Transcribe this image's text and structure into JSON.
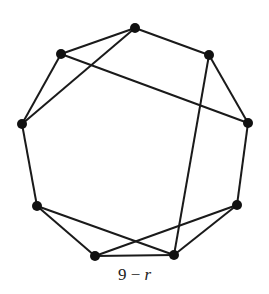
{
  "diagram": {
    "caption": {
      "number": "9",
      "minus": "−",
      "variable": "r"
    },
    "style": {
      "edge_color": "#1a1a1a",
      "node_color": "#111111",
      "node_radius": 5,
      "edge_width": 2
    },
    "nodes": [
      {
        "id": "top",
        "x": 135,
        "y": 28
      },
      {
        "id": "upper-right",
        "x": 209,
        "y": 55
      },
      {
        "id": "right",
        "x": 248,
        "y": 123
      },
      {
        "id": "lower-right",
        "x": 237,
        "y": 205
      },
      {
        "id": "bottom-right",
        "x": 174,
        "y": 255
      },
      {
        "id": "bottom-left",
        "x": 95,
        "y": 256
      },
      {
        "id": "lower-left",
        "x": 37,
        "y": 206
      },
      {
        "id": "left",
        "x": 22,
        "y": 124
      },
      {
        "id": "upper-left",
        "x": 61,
        "y": 54
      }
    ],
    "edges": [
      [
        "top",
        "upper-right"
      ],
      [
        "upper-right",
        "right"
      ],
      [
        "right",
        "lower-right"
      ],
      [
        "lower-right",
        "bottom-right"
      ],
      [
        "bottom-right",
        "bottom-left"
      ],
      [
        "bottom-left",
        "lower-left"
      ],
      [
        "lower-left",
        "left"
      ],
      [
        "left",
        "upper-left"
      ],
      [
        "upper-left",
        "top"
      ],
      [
        "top",
        "left"
      ],
      [
        "upper-left",
        "right"
      ],
      [
        "upper-right",
        "bottom-right"
      ],
      [
        "lower-left",
        "bottom-right"
      ],
      [
        "bottom-left",
        "lower-right"
      ]
    ]
  }
}
